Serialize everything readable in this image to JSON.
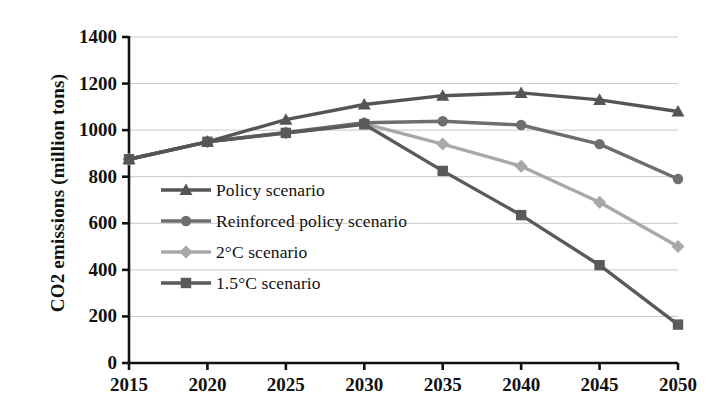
{
  "chart_data": {
    "type": "line",
    "title": "",
    "xlabel": "",
    "ylabel": "CO2 emissions (million tons)",
    "categories": [
      2015,
      2020,
      2025,
      2030,
      2035,
      2040,
      2045,
      2050
    ],
    "x_tick_labels": [
      "2015",
      "2020",
      "2025",
      "2030",
      "2035",
      "2040",
      "2045",
      "2050"
    ],
    "y_tick_labels": [
      "1400",
      "1200",
      "1000",
      "800",
      "600",
      "400",
      "200",
      "0"
    ],
    "y_ticks": [
      1400,
      1200,
      1000,
      800,
      600,
      400,
      200,
      0
    ],
    "ylim": [
      0,
      1400
    ],
    "xlim": [
      2015,
      2050
    ],
    "grid": true,
    "grid_axis": "y",
    "legend_position": "inside-left",
    "series": [
      {
        "name": "Policy scenario",
        "marker": "triangle",
        "color": "#555555",
        "values": [
          875,
          950,
          1045,
          1110,
          1148,
          1160,
          1130,
          1080
        ]
      },
      {
        "name": "Reinforced policy scenario",
        "marker": "circle",
        "color": "#6e6e6e",
        "values": [
          875,
          950,
          990,
          1032,
          1038,
          1022,
          940,
          790
        ]
      },
      {
        "name": "2°C scenario",
        "marker": "diamond",
        "color": "#a8a8a8",
        "values": [
          875,
          950,
          988,
          1028,
          940,
          845,
          690,
          500
        ]
      },
      {
        "name": "1.5°C scenario",
        "marker": "square",
        "color": "#5a5a5a",
        "values": [
          875,
          950,
          988,
          1025,
          825,
          635,
          420,
          165
        ]
      }
    ]
  },
  "legend": {
    "items": [
      {
        "label": "Policy scenario"
      },
      {
        "label": "Reinforced policy scenario"
      },
      {
        "label": "2°C scenario"
      },
      {
        "label": "1.5°C scenario"
      }
    ]
  },
  "axes": {
    "axis_color": "#111111",
    "grid_color": "#c8c8c8"
  }
}
